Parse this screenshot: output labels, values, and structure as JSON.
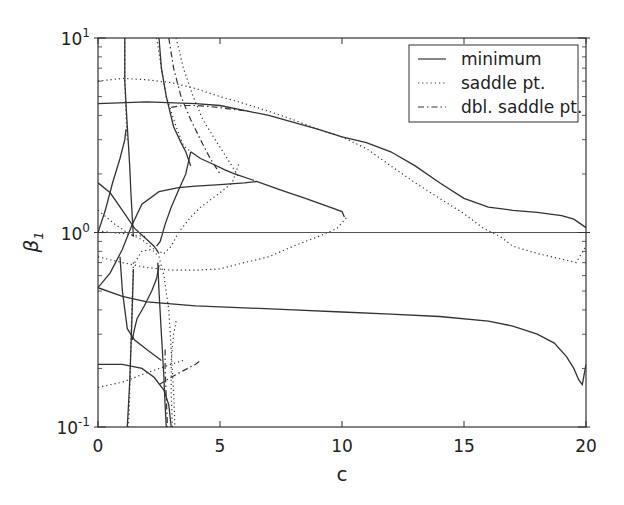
{
  "chart_data": {
    "type": "line",
    "title": "",
    "xlabel": "c",
    "ylabel": "β1",
    "xlim": [
      0,
      20
    ],
    "ylim": [
      0.1,
      10
    ],
    "yscale": "log",
    "grid": false,
    "legend_position": "upper right",
    "x_ticks": [
      0,
      5,
      10,
      15,
      20
    ],
    "x_tick_labels": [
      "0",
      "5",
      "10",
      "15",
      "20"
    ],
    "y_ticks": [
      0.1,
      1,
      10
    ],
    "y_tick_labels": [
      {
        "base": "10",
        "exp": "-1"
      },
      {
        "base": "10",
        "exp": "0"
      },
      {
        "base": "10",
        "exp": "1"
      }
    ],
    "legend": [
      {
        "label": "minimum",
        "style": "solid"
      },
      {
        "label": "saddle pt.",
        "style": "dotted"
      },
      {
        "label": "dbl. saddle pt.",
        "style": "dashdot"
      }
    ],
    "reference_line": {
      "y": 1.0,
      "style": "solid"
    },
    "series": [
      {
        "name": "minimum",
        "style": "solid",
        "x": [
          0,
          2,
          4,
          5,
          7,
          9,
          10,
          11,
          12,
          13,
          14,
          15,
          16,
          17,
          18,
          19,
          19.5,
          20
        ],
        "y": [
          4.6,
          4.7,
          4.6,
          4.5,
          4.0,
          3.4,
          3.1,
          2.9,
          2.6,
          2.2,
          1.8,
          1.5,
          1.35,
          1.3,
          1.27,
          1.22,
          1.17,
          1.06
        ]
      },
      {
        "name": "minimum",
        "style": "solid",
        "x": [
          0,
          1,
          2,
          3,
          4,
          6,
          8,
          10,
          12,
          14,
          16,
          17,
          18,
          18.7,
          19.2,
          19.5,
          19.7,
          19.85,
          20
        ],
        "y": [
          0.52,
          0.47,
          0.44,
          0.43,
          0.42,
          0.41,
          0.4,
          0.39,
          0.38,
          0.37,
          0.35,
          0.33,
          0.3,
          0.27,
          0.23,
          0.2,
          0.175,
          0.165,
          0.21
        ]
      },
      {
        "name": "minimum",
        "style": "solid",
        "x": [
          0,
          0.5,
          1,
          1.5,
          2,
          2.3,
          2.5
        ],
        "y": [
          1.8,
          1.6,
          1.3,
          1.05,
          0.92,
          0.85,
          0.78
        ]
      },
      {
        "name": "minimum",
        "style": "solid",
        "x": [
          0,
          0.5,
          1,
          1.4,
          1.8,
          2.5,
          3.3,
          4,
          5,
          6,
          6.5,
          7.5,
          8.5,
          9.5,
          10,
          10.1
        ],
        "y": [
          0.52,
          0.62,
          0.82,
          1.1,
          1.4,
          1.62,
          1.7,
          1.73,
          1.76,
          1.8,
          1.83,
          1.65,
          1.5,
          1.35,
          1.28,
          1.2
        ]
      },
      {
        "name": "minimum",
        "style": "solid",
        "x": [
          1.1,
          1.1,
          1.15,
          1.2,
          1.25,
          1.3,
          1.35,
          1.45
        ],
        "y": [
          10,
          6,
          4.5,
          3.5,
          2.8,
          2.2,
          1.6,
          0.95
        ]
      },
      {
        "name": "minimum",
        "style": "solid",
        "x": [
          0,
          0.3,
          0.6,
          0.9,
          1.1,
          1.15
        ],
        "y": [
          1.0,
          1.3,
          1.8,
          2.4,
          3.0,
          3.4
        ]
      },
      {
        "name": "minimum",
        "style": "solid",
        "x": [
          2.5,
          2.6,
          2.8,
          3.1,
          3.4,
          3.6,
          3.8
        ],
        "y": [
          10,
          7,
          5,
          3.5,
          2.9,
          2.6,
          2.2
        ]
      },
      {
        "name": "minimum",
        "style": "solid",
        "x": [
          3.8,
          4.2,
          4.7,
          5.2,
          5.6,
          6.4
        ],
        "y": [
          2.6,
          2.4,
          2.25,
          2.1,
          2.0,
          1.85
        ]
      },
      {
        "name": "minimum",
        "style": "solid",
        "x": [
          2.4,
          2.55,
          2.75,
          3.0,
          3.3,
          3.6,
          3.8
        ],
        "y": [
          0.85,
          0.9,
          1.1,
          1.35,
          1.65,
          2.0,
          2.6
        ]
      },
      {
        "name": "minimum",
        "style": "solid",
        "x": [
          0.9,
          1.0,
          1.2,
          1.5,
          2.0,
          2.6
        ],
        "y": [
          0.75,
          0.5,
          0.32,
          0.28,
          0.25,
          0.22
        ]
      },
      {
        "name": "minimum",
        "style": "solid",
        "x": [
          1.4,
          1.5,
          1.6,
          1.9,
          2.2,
          2.4,
          2.5
        ],
        "y": [
          0.28,
          0.32,
          0.36,
          0.42,
          0.5,
          0.58,
          0.68
        ]
      },
      {
        "name": "minimum",
        "style": "solid",
        "x": [
          0,
          1,
          1.8,
          2.3,
          2.7,
          2.9,
          3.0
        ],
        "y": [
          0.21,
          0.21,
          0.2,
          0.18,
          0.155,
          0.13,
          0.1
        ]
      },
      {
        "name": "minimum",
        "style": "solid",
        "x": [
          2.45,
          2.5,
          2.6,
          2.7,
          2.75,
          2.8
        ],
        "y": [
          0.7,
          0.5,
          0.3,
          0.18,
          0.13,
          0.1
        ]
      },
      {
        "name": "minimum",
        "style": "solid",
        "x": [
          1.45,
          1.4,
          1.35,
          1.3,
          1.25,
          1.2
        ],
        "y": [
          0.65,
          0.4,
          0.25,
          0.17,
          0.13,
          0.1
        ]
      },
      {
        "name": "saddle pt.",
        "style": "dotted",
        "x": [
          0,
          1,
          2,
          3,
          4,
          5,
          6,
          7,
          8,
          9,
          10,
          11,
          12,
          13,
          14,
          15,
          15.8,
          16.5,
          17,
          18,
          19,
          19.6,
          20
        ],
        "y": [
          6.0,
          6.2,
          6.1,
          5.9,
          5.5,
          5.0,
          4.6,
          4.2,
          3.8,
          3.4,
          3.1,
          2.7,
          2.2,
          1.8,
          1.5,
          1.25,
          1.05,
          0.95,
          0.85,
          0.78,
          0.73,
          0.7,
          0.85
        ]
      },
      {
        "name": "saddle pt.",
        "style": "dotted",
        "x": [
          0,
          1,
          2,
          3,
          4,
          5,
          6,
          7,
          8,
          9,
          9.8,
          10.2
        ],
        "y": [
          0.75,
          0.7,
          0.66,
          0.64,
          0.64,
          0.65,
          0.7,
          0.75,
          0.85,
          0.95,
          1.05,
          1.2
        ]
      },
      {
        "name": "saddle pt.",
        "style": "dotted",
        "x": [
          0,
          0.7,
          1.3,
          1.8,
          2.3,
          2.7
        ],
        "y": [
          1.3,
          1.1,
          0.98,
          0.92,
          0.82,
          0.78
        ]
      },
      {
        "name": "saddle pt.",
        "style": "dotted",
        "x": [
          2.7,
          3.0,
          3.3,
          3.8,
          4.2,
          5.0,
          5.5,
          5.8
        ],
        "y": [
          0.78,
          0.85,
          1.0,
          1.2,
          1.35,
          1.6,
          1.8,
          2.3
        ]
      },
      {
        "name": "saddle pt.",
        "style": "dotted",
        "x": [
          0,
          0.5,
          1.0,
          1.5,
          2.0
        ],
        "y": [
          1.02,
          1.0,
          0.99,
          0.97,
          0.95
        ]
      },
      {
        "name": "saddle pt.",
        "style": "dotted",
        "x": [
          2.4,
          2.6,
          2.8,
          3.2,
          3.5,
          3.8
        ],
        "y": [
          10,
          7,
          5,
          3.5,
          2.8,
          2.6
        ]
      },
      {
        "name": "saddle pt.",
        "style": "dotted",
        "x": [
          3.2,
          3.5,
          3.9,
          4.3,
          4.8,
          5.3,
          5.8
        ],
        "y": [
          10,
          7,
          5,
          3.8,
          3.0,
          2.4,
          1.9
        ]
      },
      {
        "name": "saddle pt.",
        "style": "dotted",
        "x": [
          1.5,
          1.8,
          2.2,
          2.5,
          2.7,
          2.9,
          3.0,
          3.1,
          3.15
        ],
        "y": [
          0.7,
          0.8,
          0.82,
          0.75,
          0.6,
          0.4,
          0.25,
          0.15,
          0.1
        ]
      },
      {
        "name": "saddle pt.",
        "style": "dotted",
        "x": [
          1.45,
          1.4,
          1.35,
          1.3,
          1.25
        ],
        "y": [
          0.7,
          0.45,
          0.28,
          0.15,
          0.1
        ]
      },
      {
        "name": "saddle pt.",
        "style": "dotted",
        "x": [
          0,
          1,
          2,
          3,
          3.5
        ],
        "y": [
          0.16,
          0.17,
          0.19,
          0.21,
          0.22
        ]
      },
      {
        "name": "saddle pt.",
        "style": "dotted",
        "x": [
          1.1,
          1.1,
          1.15,
          1.2
        ],
        "y": [
          10,
          6,
          4,
          3
        ]
      },
      {
        "name": "saddle pt.",
        "style": "dotted",
        "x": [
          3.2,
          3.1,
          3.0,
          3.0,
          3.05
        ],
        "y": [
          0.35,
          0.3,
          0.22,
          0.15,
          0.1
        ]
      },
      {
        "name": "dbl. saddle pt.",
        "style": "dashdot",
        "x": [
          2.9,
          3.1,
          3.4,
          3.8,
          4.2,
          4.6,
          5.0
        ],
        "y": [
          10,
          7,
          5,
          3.8,
          3.0,
          2.4,
          2.0
        ]
      },
      {
        "name": "dbl. saddle pt.",
        "style": "dashdot",
        "x": [
          3.0,
          3.5,
          4.0,
          4.5,
          4.9,
          5.5,
          6.2
        ],
        "y": [
          4.4,
          4.5,
          4.5,
          4.45,
          4.4,
          4.3,
          4.2
        ]
      },
      {
        "name": "dbl. saddle pt.",
        "style": "dashdot",
        "x": [
          2.5,
          3.0,
          3.5,
          4.0,
          4.2
        ],
        "y": [
          0.165,
          0.18,
          0.195,
          0.21,
          0.22
        ]
      },
      {
        "name": "dbl. saddle pt.",
        "style": "dashdot",
        "x": [
          2.75,
          2.75,
          2.8,
          2.85
        ],
        "y": [
          0.25,
          0.2,
          0.14,
          0.1
        ]
      }
    ]
  }
}
